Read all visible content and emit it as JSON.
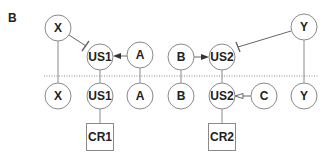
{
  "panel_label": "B",
  "colors": {
    "stroke": "#8a8a8a",
    "text": "#222222",
    "background": "#ffffff"
  },
  "top_row": {
    "X": "X",
    "US1": "US1",
    "A": "A",
    "B": "B",
    "US2": "US2",
    "Y": "Y"
  },
  "bottom_row": {
    "X": "X",
    "US1": "US1",
    "A": "A",
    "B": "B",
    "US2": "US2",
    "C": "C",
    "Y": "Y"
  },
  "boxes": {
    "CR1": "CR1",
    "CR2": "CR2"
  },
  "edges": [
    {
      "from": "X",
      "to": "US1",
      "type": "inhibition",
      "row": "top"
    },
    {
      "from": "A",
      "to": "US1",
      "type": "activation-filled-arrow",
      "row": "top"
    },
    {
      "from": "B",
      "to": "US2",
      "type": "activation-filled-arrow",
      "row": "top"
    },
    {
      "from": "Y",
      "to": "US2",
      "type": "inhibition",
      "row": "top"
    },
    {
      "from": "C",
      "to": "US2",
      "type": "open-arrow",
      "row": "bottom"
    },
    {
      "from": "US1",
      "to": "CR1",
      "type": "line",
      "row": "bottom"
    },
    {
      "from": "US2",
      "to": "CR2",
      "type": "line",
      "row": "bottom"
    }
  ],
  "separator": "dotted"
}
